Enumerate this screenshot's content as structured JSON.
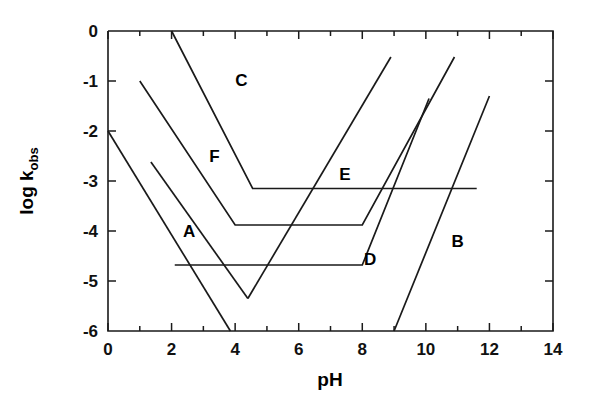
{
  "chart_data": {
    "type": "line",
    "title": "",
    "xlabel": "pH",
    "ylabel": "log k",
    "ylabel_sub": "obs",
    "xlim": [
      0,
      14
    ],
    "ylim": [
      -6,
      0
    ],
    "xticks": [
      0,
      2,
      4,
      6,
      8,
      10,
      12,
      14
    ],
    "xtick_labels": [
      "0",
      "2",
      "4",
      "6",
      "8",
      "10",
      "12",
      "14"
    ],
    "xminor_step": 1,
    "yticks": [
      0,
      -1,
      -2,
      -3,
      -4,
      -5,
      -6
    ],
    "ytick_labels": [
      "0",
      "-1",
      "-2",
      "-3",
      "-4",
      "-5",
      "-6"
    ],
    "grid": false,
    "legend": "inline-labels",
    "series": [
      {
        "name": "A",
        "label": "A",
        "label_x": 2.55,
        "label_y": -4.12,
        "points": [
          [
            0.0,
            -2.0
          ],
          [
            3.85,
            -6.0
          ]
        ]
      },
      {
        "name": "B",
        "label": "B",
        "label_x": 11.0,
        "label_y": -4.32,
        "points": [
          [
            9.0,
            -6.0
          ],
          [
            12.0,
            -1.3
          ]
        ]
      },
      {
        "name": "C",
        "label": "C",
        "label_x": 4.2,
        "label_y": -1.1,
        "points": [
          [
            2.0,
            0.0
          ],
          [
            4.55,
            -3.15
          ],
          [
            11.6,
            -3.15
          ]
        ]
      },
      {
        "name": "D",
        "label": "D",
        "label_x": 8.25,
        "label_y": -4.68,
        "points": [
          [
            2.1,
            -4.68
          ],
          [
            8.0,
            -4.68
          ],
          [
            10.1,
            -1.35
          ]
        ]
      },
      {
        "name": "E",
        "label": "E",
        "label_x": 7.45,
        "label_y": -2.97,
        "points": [
          [
            4.4,
            -5.35
          ],
          [
            8.9,
            -0.52
          ]
        ]
      },
      {
        "name": "F",
        "label": "F",
        "label_x": 3.35,
        "label_y": -2.62,
        "points": [
          [
            1.0,
            -1.0
          ],
          [
            4.0,
            -3.88
          ],
          [
            8.0,
            -3.88
          ],
          [
            10.9,
            -0.52
          ]
        ]
      },
      {
        "name": "A-descending-extra",
        "label": "",
        "label_x": 0,
        "label_y": 0,
        "points": [
          [
            1.35,
            -2.62
          ],
          [
            4.4,
            -5.35
          ]
        ]
      }
    ]
  },
  "axes": {
    "x_title": "pH",
    "y_title_main": "log k",
    "y_title_sub": "obs"
  },
  "colors": {
    "stroke": "#1a1a1a",
    "background": "#ffffff",
    "text": "#000000"
  }
}
